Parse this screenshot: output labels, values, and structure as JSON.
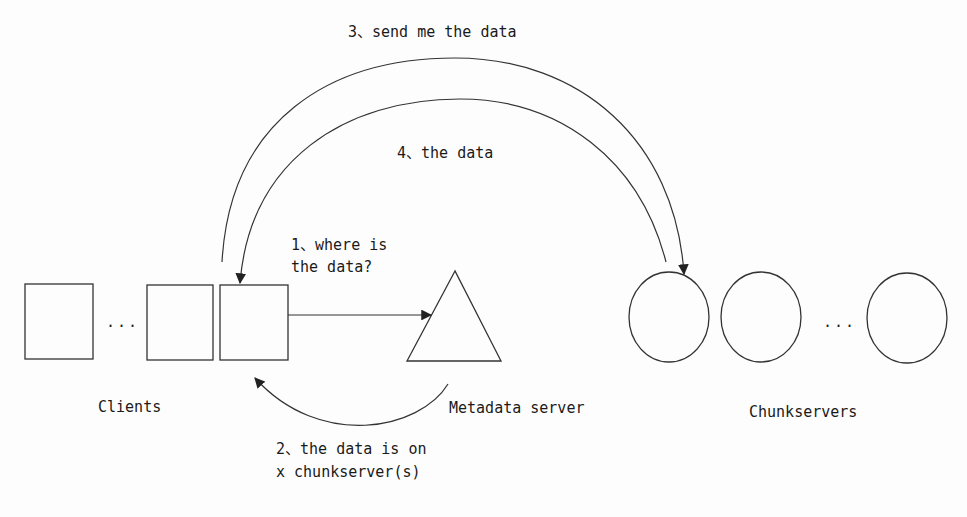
{
  "diagram": {
    "title": "",
    "nodes": {
      "clients": {
        "label": "Clients",
        "shape": "rectangle",
        "count_visible": 3,
        "ellipsis": "..."
      },
      "metadata_server": {
        "label": "Metadata server",
        "shape": "triangle"
      },
      "chunkservers": {
        "label": "Chunkservers",
        "shape": "circle",
        "count_visible": 3,
        "ellipsis": "..."
      }
    },
    "edges": [
      {
        "id": 1,
        "from": "clients",
        "to": "metadata_server",
        "label_line1": "1、where is",
        "label_line2": "the data?"
      },
      {
        "id": 2,
        "from": "metadata_server",
        "to": "clients",
        "label_line1": "2、the data is on",
        "label_line2": "x chunkserver(s)"
      },
      {
        "id": 3,
        "from": "clients",
        "to": "chunkservers",
        "label": "3、send me the data"
      },
      {
        "id": 4,
        "from": "chunkservers",
        "to": "clients",
        "label": "4、the data"
      }
    ]
  },
  "colors": {
    "stroke": "#333333",
    "text": "#1a1a1a",
    "background": "#fdfdfd"
  }
}
